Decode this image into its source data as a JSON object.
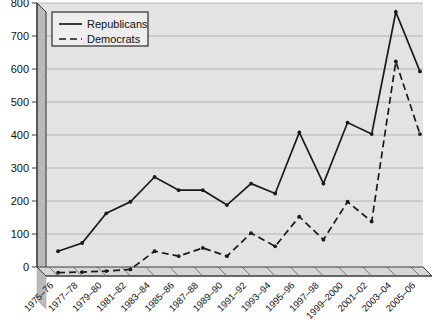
{
  "chart_data": {
    "type": "line",
    "title": "",
    "subtitle": "",
    "xlabel": "",
    "ylabel": "",
    "ylim": [
      0,
      800
    ],
    "yticks": [
      0,
      100,
      200,
      300,
      400,
      500,
      600,
      700,
      800
    ],
    "grid": true,
    "legend_position": "top-left",
    "style": "3d-perspective",
    "categories": [
      "1975–76",
      "1977–78",
      "1979–80",
      "1981–82",
      "1983–84",
      "1985–86",
      "1987–88",
      "1989–90",
      "1991–92",
      "1993–94",
      "1995–96",
      "1997–98",
      "1999–2000",
      "2001–02",
      "2003–04",
      "2005–06"
    ],
    "series": [
      {
        "name": "Republicans",
        "line_style": "solid",
        "color": "#1a1a1a",
        "values": [
          75,
          100,
          190,
          225,
          300,
          260,
          260,
          215,
          280,
          250,
          435,
          280,
          465,
          430,
          800,
          620
        ]
      },
      {
        "name": "Democrats",
        "line_style": "dashed",
        "color": "#1a1a1a",
        "values": [
          10,
          12,
          15,
          20,
          75,
          60,
          85,
          60,
          130,
          90,
          180,
          110,
          225,
          165,
          650,
          430
        ]
      }
    ]
  },
  "legend": {
    "entries": [
      {
        "label": "Republicans",
        "style": "solid"
      },
      {
        "label": "Democrats",
        "style": "dashed"
      }
    ]
  },
  "colors": {
    "plot_background": "#e3e3e3",
    "wall_side": "#b9b9b9",
    "wall_top": "#cfcfcf",
    "floor": "#d6d6d6",
    "gridline": "#a8a8a8",
    "axis": "#3c3c3c",
    "line": "#1a1a1a",
    "legend_background": "#ededed",
    "legend_border": "#2b2b2b"
  }
}
